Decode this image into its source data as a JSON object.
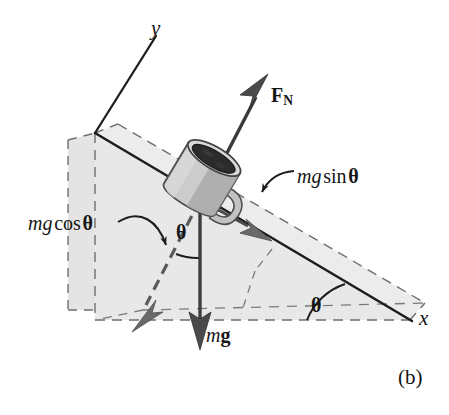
{
  "figure": {
    "caption": "(b)",
    "background_color": "#ffffff",
    "ink_color": "#151515",
    "incline_fill": "#e8e8e8",
    "incline_side_fill": "#dedede",
    "mug_body_color": "#cfcfcf",
    "mug_shadow_color": "#9a9a9a",
    "coffee_color": "#2a2a2a"
  },
  "axes": {
    "x_label": "x",
    "y_label": "y"
  },
  "vectors": {
    "normal_force": {
      "label_m": "F",
      "label_sub": "N",
      "style": "solid",
      "direction": "up-right, perpendicular to incline surface"
    },
    "weight": {
      "label_italic": "m",
      "label_bold": "g",
      "style": "solid",
      "direction": "straight down"
    },
    "mg_sin_theta": {
      "label_italic": "mg",
      "label_function": "sin",
      "label_theta": "θ",
      "style": "solid",
      "direction": "down the incline"
    },
    "mg_cos_theta": {
      "label_italic": "mg",
      "label_function": "cos",
      "label_theta": "θ",
      "style": "dashed",
      "direction": "into the incline, perpendicular"
    }
  },
  "angles": {
    "theta_at_mug": "θ",
    "theta_at_base": "θ"
  }
}
